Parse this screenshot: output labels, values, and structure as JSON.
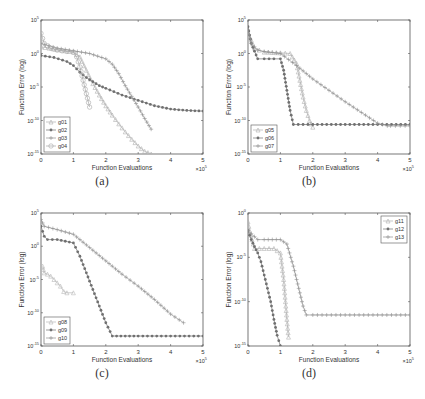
{
  "figure": {
    "captions": [
      "(a)",
      "(b)",
      "(c)",
      "(d)"
    ]
  },
  "chart_data": [
    {
      "type": "line",
      "panel": "(a)",
      "xlabel": "Function Evaluations",
      "ylabel": "Function Error (log)",
      "x_multiplier": "×10^5",
      "xlim": [
        0,
        5
      ],
      "ylim_exp": [
        -15,
        5
      ],
      "yscale": "log",
      "xticks": [
        "0",
        "1",
        "2",
        "3",
        "4",
        "5"
      ],
      "yticks": [
        "10^5",
        "10^0",
        "10^-5",
        "10^-10",
        "10^-15"
      ],
      "legend_position": "lower left",
      "series": [
        {
          "name": "g01",
          "marker": "triangle",
          "color": "#b0b0b0",
          "x": [
            0,
            0.5,
            1.0,
            1.2,
            1.4,
            1.6,
            1.8,
            2.0,
            2.2,
            2.4,
            2.6,
            2.8,
            3.0,
            3.2,
            3.4
          ],
          "y_exp": [
            1.0,
            0.6,
            0.2,
            -0.5,
            -2.5,
            -4.5,
            -6.2,
            -7.8,
            -9.2,
            -10.5,
            -11.7,
            -12.8,
            -13.8,
            -14.6,
            -15.0
          ]
        },
        {
          "name": "g02",
          "marker": "star",
          "color": "#707070",
          "x": [
            0,
            0.4,
            0.8,
            1.0,
            1.2,
            1.4,
            1.6,
            1.8,
            2.0,
            2.5,
            3.0,
            3.5,
            4.0,
            4.5,
            5.0
          ],
          "y_exp": [
            -0.3,
            -0.6,
            -1.2,
            -1.8,
            -2.8,
            -3.6,
            -4.2,
            -4.8,
            -5.2,
            -6.2,
            -7.0,
            -7.8,
            -8.3,
            -8.5,
            -8.6
          ]
        },
        {
          "name": "g03",
          "marker": "plus",
          "color": "#909090",
          "x": [
            0,
            0.5,
            1.0,
            1.5,
            2.0,
            2.2,
            2.4,
            2.6,
            2.8,
            3.0,
            3.2,
            3.4
          ],
          "y_exp": [
            1.5,
            0.8,
            0.4,
            0.0,
            -0.8,
            -1.6,
            -3.0,
            -4.8,
            -6.4,
            -8.0,
            -9.7,
            -11.3
          ]
        },
        {
          "name": "g04",
          "marker": "circle",
          "color": "#a8a8a8",
          "x": [
            0,
            0.1,
            0.3,
            0.5,
            0.8,
            1.0,
            1.1,
            1.2,
            1.3,
            1.4,
            1.5
          ],
          "y_exp": [
            3.0,
            1.5,
            0.8,
            0.5,
            0.3,
            0.2,
            -0.5,
            -2.0,
            -4.0,
            -6.0,
            -8.0
          ]
        }
      ]
    },
    {
      "type": "line",
      "panel": "(b)",
      "xlabel": "Function Evaluations",
      "ylabel": "Function Error (log)",
      "x_multiplier": "×10^5",
      "xlim": [
        0,
        5
      ],
      "ylim_exp": [
        -15,
        5
      ],
      "yscale": "log",
      "xticks": [
        "0",
        "1",
        "2",
        "3",
        "4",
        "5"
      ],
      "yticks": [
        "10^5",
        "10^0",
        "10^-5",
        "10^-10",
        "10^-15"
      ],
      "legend_position": "lower left",
      "series": [
        {
          "name": "g05",
          "marker": "triangle",
          "color": "#b0b0b0",
          "x": [
            0,
            0.1,
            0.2,
            0.5,
            1.0,
            1.3,
            1.5,
            1.6,
            1.7,
            1.8,
            1.9,
            2.0
          ],
          "y_exp": [
            3.0,
            2.0,
            0.8,
            0.2,
            0.1,
            0.0,
            -1.5,
            -4.0,
            -6.5,
            -8.5,
            -10.0,
            -11.0
          ]
        },
        {
          "name": "g06",
          "marker": "star",
          "color": "#707070",
          "x": [
            0,
            0.1,
            0.3,
            0.5,
            0.8,
            1.0,
            1.1,
            1.2,
            1.3,
            1.4,
            2.0,
            3.0,
            4.0,
            5.0
          ],
          "y_exp": [
            4.0,
            1.5,
            -0.8,
            -0.8,
            -0.8,
            -0.8,
            -2.5,
            -5.5,
            -8.5,
            -10.6,
            -10.6,
            -10.6,
            -10.6,
            -10.6
          ]
        },
        {
          "name": "g07",
          "marker": "plus",
          "color": "#909090",
          "x": [
            0,
            0.1,
            0.3,
            0.5,
            1.0,
            1.5,
            2.0,
            2.5,
            3.0,
            3.5,
            4.0,
            4.3,
            4.4,
            5.0
          ],
          "y_exp": [
            3.5,
            1.5,
            0.5,
            0.3,
            0.0,
            -1.8,
            -3.8,
            -5.5,
            -7.2,
            -8.8,
            -10.4,
            -10.8,
            -10.8,
            -10.8
          ]
        }
      ]
    },
    {
      "type": "line",
      "panel": "(c)",
      "xlabel": "Function Evaluations",
      "ylabel": "Function Error (log)",
      "x_multiplier": "×10^5",
      "xlim": [
        0,
        5
      ],
      "ylim_exp": [
        -15,
        5
      ],
      "yscale": "log",
      "xticks": [
        "0",
        "1",
        "2",
        "3",
        "4",
        "5"
      ],
      "yticks": [
        "10^5",
        "10^0",
        "10^-5",
        "10^-10",
        "10^-15"
      ],
      "legend_position": "lower left",
      "series": [
        {
          "name": "g08",
          "marker": "triangle",
          "color": "#b8b8b8",
          "x": [
            0.05,
            0.1,
            0.2,
            0.3,
            0.4,
            0.5,
            0.6,
            0.7,
            0.8,
            1.0
          ],
          "y_exp": [
            -3.0,
            -4.0,
            -4.2,
            -4.5,
            -5.0,
            -5.5,
            -6.0,
            -6.8,
            -7.0,
            -7.0
          ]
        },
        {
          "name": "g09",
          "marker": "star",
          "color": "#707070",
          "x": [
            0,
            0.1,
            0.2,
            0.5,
            1.0,
            1.2,
            1.4,
            1.6,
            1.8,
            2.0,
            2.2,
            3.0,
            4.0,
            5.0
          ],
          "y_exp": [
            3.0,
            1.5,
            1.0,
            1.0,
            0.5,
            -1.5,
            -4.0,
            -6.5,
            -9.0,
            -11.5,
            -13.5,
            -13.5,
            -13.5,
            -13.5
          ]
        },
        {
          "name": "g10",
          "marker": "plus",
          "color": "#909090",
          "x": [
            0,
            0.1,
            0.5,
            1.0,
            1.5,
            2.0,
            2.5,
            3.0,
            3.5,
            4.0,
            4.4
          ],
          "y_exp": [
            4.0,
            3.0,
            2.5,
            1.8,
            -0.2,
            -2.2,
            -4.2,
            -6.0,
            -8.0,
            -10.2,
            -11.5
          ]
        }
      ]
    },
    {
      "type": "line",
      "panel": "(d)",
      "xlabel": "Function Evaluations",
      "ylabel": "Function Error (log)",
      "x_multiplier": "×10^5",
      "xlim": [
        0,
        5
      ],
      "ylim_exp": [
        -15,
        0
      ],
      "yscale": "log",
      "xticks": [
        "0",
        "1",
        "2",
        "3",
        "4",
        "5"
      ],
      "yticks": [
        "10^0",
        "10^-5",
        "10^-10",
        "10^-15"
      ],
      "legend_position": "upper right",
      "series": [
        {
          "name": "g11",
          "marker": "triangle",
          "color": "#b0b0b0",
          "x": [
            0,
            0.05,
            0.2,
            0.5,
            0.8,
            1.0,
            1.1,
            1.2,
            1.25
          ],
          "y_exp": [
            -1.0,
            -2.0,
            -4.0,
            -4.0,
            -4.0,
            -4.5,
            -7.5,
            -12.0,
            -14.0
          ]
        },
        {
          "name": "g12",
          "marker": "star",
          "color": "#707070",
          "x": [
            0,
            0.1,
            0.2,
            0.3,
            0.4,
            0.5,
            0.6,
            0.7,
            0.8,
            0.9,
            1.0
          ],
          "y_exp": [
            -2.0,
            -3.0,
            -3.8,
            -4.5,
            -5.5,
            -7.0,
            -8.5,
            -10.0,
            -12.0,
            -13.8,
            -15.0
          ]
        },
        {
          "name": "g13",
          "marker": "plus",
          "color": "#909090",
          "x": [
            0,
            0.3,
            0.5,
            1.0,
            1.2,
            1.4,
            1.6,
            1.7,
            1.8,
            2.0,
            3.0,
            4.0,
            5.0
          ],
          "y_exp": [
            -2.0,
            -3.0,
            -3.0,
            -3.0,
            -3.5,
            -6.0,
            -9.0,
            -10.5,
            -11.5,
            -11.5,
            -11.5,
            -11.5,
            -11.5
          ]
        }
      ]
    }
  ]
}
